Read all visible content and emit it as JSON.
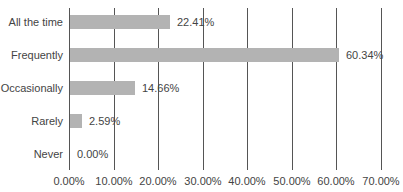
{
  "chart_data": {
    "type": "bar",
    "orientation": "horizontal",
    "title": "",
    "xlabel": "",
    "ylabel": "",
    "categories": [
      "All the time",
      "Frequently",
      "Occasionally",
      "Rarely",
      "Never"
    ],
    "values": [
      22.41,
      60.34,
      14.66,
      2.59,
      0.0
    ],
    "value_labels": [
      "22.41%",
      "60.34%",
      "14.66%",
      "2.59%",
      "0.00%"
    ],
    "xlim": [
      0,
      70
    ],
    "x_ticks": [
      "0.00%",
      "10.00%",
      "20.00%",
      "30.00%",
      "40.00%",
      "50.00%",
      "60.00%",
      "70.00%"
    ],
    "grid": true,
    "legend": null,
    "bar_color": "#b3b3b3"
  }
}
